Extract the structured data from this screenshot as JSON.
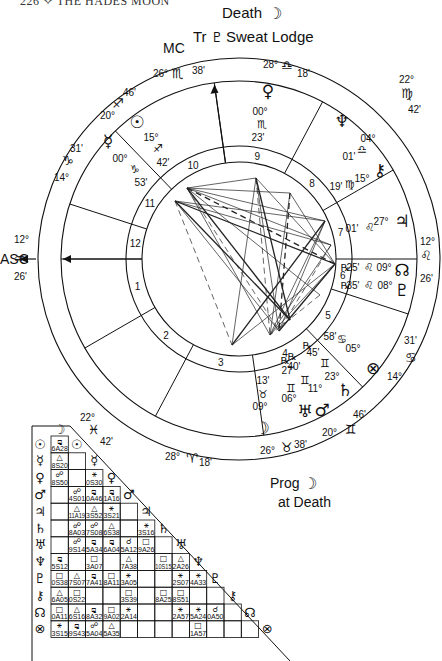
{
  "page_header": "226 ✧ THE HADES MOON",
  "captions": {
    "top_line1": "Death",
    "top_line1_symbol": "☽",
    "top_line2_prefix": "Tr",
    "top_line2_symbol": "♇",
    "top_line2_suffix": "Sweat Lodge",
    "mc_label": "MC",
    "asc_label": "ASC",
    "bottom_line1": "Prog",
    "bottom_line1_symbol": "☽",
    "bottom_line2": "at Death"
  },
  "house_cusps": [
    {
      "house": 1,
      "deg": "12°",
      "sign": "♒",
      "min": "26'"
    },
    {
      "house": 2,
      "deg": "22°",
      "sign": "♓",
      "min": "42'"
    },
    {
      "house": 3,
      "deg": "28°",
      "sign": "♈",
      "min": "18'"
    },
    {
      "house": 4,
      "deg": "26°",
      "sign": "♉",
      "min": "38'"
    },
    {
      "house": 5,
      "deg": "20°",
      "sign": "♊",
      "min": "46'"
    },
    {
      "house": 6,
      "deg": "14°",
      "sign": "♋",
      "min": "31'"
    },
    {
      "house": 7,
      "deg": "12°",
      "sign": "♌",
      "min": "26'"
    },
    {
      "house": 8,
      "deg": "22°",
      "sign": "♍",
      "min": "42'"
    },
    {
      "house": 9,
      "deg": "28°",
      "sign": "♎",
      "min": "18'"
    },
    {
      "house": 10,
      "deg": "26°",
      "sign": "♏",
      "min": "38'"
    },
    {
      "house": 11,
      "deg": "20°",
      "sign": "♐",
      "min": "46'"
    },
    {
      "house": 12,
      "deg": "14°",
      "sign": "♑",
      "min": "31'"
    }
  ],
  "house_numbers": [
    "1",
    "2",
    "3",
    "4",
    "5",
    "6",
    "7",
    "8",
    "9",
    "10",
    "11",
    "12"
  ],
  "planets": [
    {
      "name": "Sun",
      "glyph": "☉",
      "deg": "15°",
      "sign": "♐",
      "min": "42'",
      "retro": ""
    },
    {
      "name": "Mercury",
      "glyph": "☿",
      "deg": "00°",
      "sign": "♑",
      "min": "53'",
      "retro": ""
    },
    {
      "name": "Venus",
      "glyph": "♀",
      "deg": "00°",
      "sign": "♏",
      "min": "23'",
      "retro": ""
    },
    {
      "name": "Neptune",
      "glyph": "♆",
      "deg": "04°",
      "sign": "♎",
      "min": "01'",
      "retro": ""
    },
    {
      "name": "Chiron",
      "glyph": "⚷",
      "deg": "15°",
      "sign": "♍",
      "min": "19'",
      "retro": ""
    },
    {
      "name": "Jupiter",
      "glyph": "♃",
      "deg": "27°",
      "sign": "♌",
      "min": "01'",
      "retro": ""
    },
    {
      "name": "North Node",
      "glyph": "☊",
      "deg": "09°",
      "sign": "♌",
      "min": "25'",
      "retro": "℞"
    },
    {
      "name": "Pluto",
      "glyph": "♇",
      "deg": "08°",
      "sign": "♌",
      "min": "35'",
      "retro": "℞"
    },
    {
      "name": "Part of Fortune",
      "glyph": "⊗",
      "deg": "05°",
      "sign": "♋",
      "min": "58'",
      "retro": ""
    },
    {
      "name": "Saturn",
      "glyph": "♄",
      "deg": "23°",
      "sign": "♊",
      "min": "45'",
      "retro": "℞"
    },
    {
      "name": "Mars",
      "glyph": "♂",
      "deg": "11°",
      "sign": "♊",
      "min": "40'",
      "retro": "℞"
    },
    {
      "name": "Uranus",
      "glyph": "♅",
      "deg": "06°",
      "sign": "♊",
      "min": "27'",
      "retro": "℞"
    },
    {
      "name": "Moon",
      "glyph": "☽",
      "deg": "09°",
      "sign": "♉",
      "min": "13'",
      "retro": ""
    }
  ],
  "aspect_grid": {
    "rows": [
      {
        "glyph": "☉",
        "cells": [
          {
            "sym": "⚼",
            "val": "6A28"
          }
        ]
      },
      {
        "glyph": "☿",
        "cells": [
          {
            "sym": "△",
            "val": "8S20"
          },
          {
            "sym": "",
            "val": ""
          }
        ]
      },
      {
        "glyph": "♀",
        "cells": [
          {
            "sym": "☍",
            "val": "8S50"
          },
          {
            "sym": "",
            "val": ""
          },
          {
            "sym": "⚹",
            "val": "0S30"
          }
        ]
      },
      {
        "glyph": "♂",
        "cells": [
          {
            "sym": "",
            "val": ""
          },
          {
            "sym": "☍",
            "val": "4S01"
          },
          {
            "sym": "⚼",
            "val": "0A46"
          },
          {
            "sym": "⚼",
            "val": "1A16"
          }
        ]
      },
      {
        "glyph": "♃",
        "cells": [
          {
            "sym": "",
            "val": ""
          },
          {
            "sym": "△",
            "val": "11A19"
          },
          {
            "sym": "△",
            "val": "3S52"
          },
          {
            "sym": "⚹",
            "val": "3S21"
          },
          {
            "sym": "",
            "val": ""
          }
        ]
      },
      {
        "glyph": "♄",
        "cells": [
          {
            "sym": "",
            "val": ""
          },
          {
            "sym": "☍",
            "val": "8A03"
          },
          {
            "sym": "☍",
            "val": "7S08"
          },
          {
            "sym": "△",
            "val": "6S38"
          },
          {
            "sym": "",
            "val": ""
          },
          {
            "sym": "⚹",
            "val": "3S16"
          }
        ]
      },
      {
        "glyph": "♅",
        "cells": [
          {
            "sym": "",
            "val": ""
          },
          {
            "sym": "☍",
            "val": "9S14"
          },
          {
            "sym": "⚼",
            "val": "5A34"
          },
          {
            "sym": "⚼",
            "val": "6A04"
          },
          {
            "sym": "☌",
            "val": "5A12"
          },
          {
            "sym": "□",
            "val": "9A26"
          },
          {
            "sym": "",
            "val": ""
          }
        ]
      },
      {
        "glyph": "♆",
        "cells": [
          {
            "sym": "⚼",
            "val": "5S12"
          },
          {
            "sym": "",
            "val": ""
          },
          {
            "sym": "□",
            "val": "3A07"
          },
          {
            "sym": "",
            "val": ""
          },
          {
            "sym": "△",
            "val": "7A38"
          },
          {
            "sym": "",
            "val": ""
          },
          {
            "sym": "□",
            "val": "10S15"
          },
          {
            "sym": "△",
            "val": "2A26"
          }
        ]
      },
      {
        "glyph": "♇",
        "cells": [
          {
            "sym": "□",
            "val": "0S38"
          },
          {
            "sym": "△",
            "val": "7S07"
          },
          {
            "sym": "⚼",
            "val": "7A41"
          },
          {
            "sym": "□",
            "val": "8A11"
          },
          {
            "sym": "⚹",
            "val": "3A05"
          },
          {
            "sym": "",
            "val": ""
          },
          {
            "sym": "",
            "val": ""
          },
          {
            "sym": "⚹",
            "val": "2S07"
          },
          {
            "sym": "⚹",
            "val": "4A33"
          }
        ]
      },
      {
        "glyph": "⚷",
        "cells": [
          {
            "sym": "△",
            "val": "6A05"
          },
          {
            "sym": "□",
            "val": "0S22"
          },
          {
            "sym": "",
            "val": ""
          },
          {
            "sym": "",
            "val": ""
          },
          {
            "sym": "□",
            "val": "3S39"
          },
          {
            "sym": "",
            "val": ""
          },
          {
            "sym": "□",
            "val": "8A25"
          },
          {
            "sym": "□",
            "val": "8S51"
          },
          {
            "sym": "",
            "val": ""
          },
          {
            "sym": "",
            "val": ""
          }
        ]
      },
      {
        "glyph": "☊",
        "cells": [
          {
            "sym": "□",
            "val": "0A11"
          },
          {
            "sym": "△",
            "val": "6S16"
          },
          {
            "sym": "⚼",
            "val": "8A32"
          },
          {
            "sym": "□",
            "val": "9A02"
          },
          {
            "sym": "⚹",
            "val": "2A14"
          },
          {
            "sym": "",
            "val": ""
          },
          {
            "sym": "",
            "val": ""
          },
          {
            "sym": "⚹",
            "val": "2A57"
          },
          {
            "sym": "⚹",
            "val": "5A24"
          },
          {
            "sym": "☌",
            "val": "0A50"
          },
          {
            "sym": "",
            "val": ""
          }
        ]
      },
      {
        "glyph": "⊗",
        "cells": [
          {
            "sym": "⚹",
            "val": "3S15"
          },
          {
            "sym": "⚼",
            "val": "9S43"
          },
          {
            "sym": "☍",
            "val": "5A04"
          },
          {
            "sym": "△",
            "val": "5A35"
          },
          {
            "sym": "",
            "val": ""
          },
          {
            "sym": "",
            "val": ""
          },
          {
            "sym": "",
            "val": ""
          },
          {
            "sym": "",
            "val": ""
          },
          {
            "sym": "□",
            "val": "1A57"
          },
          {
            "sym": "",
            "val": ""
          },
          {
            "sym": "",
            "val": ""
          },
          {
            "sym": "",
            "val": ""
          }
        ]
      }
    ],
    "top_glyph": "☽",
    "diag_glyphs": [
      "☉",
      "☿",
      "♀",
      "♂",
      "♃",
      "♄",
      "♅",
      "♆",
      "♇",
      "⚷",
      "☊",
      "⊗"
    ]
  }
}
